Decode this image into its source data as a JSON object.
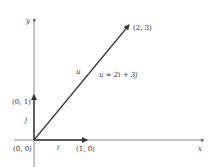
{
  "diagram": {
    "axes": {
      "x_label": "x",
      "y_label": "y",
      "origin_label": "(0, 0)"
    },
    "vectors": [
      {
        "name": "i",
        "label": "i",
        "tip_label": "(1, 0)"
      },
      {
        "name": "j",
        "label": "j",
        "tip_label": "(0, 1)"
      },
      {
        "name": "u",
        "label": "u",
        "tip_label": "(2, 3)",
        "equation": "u = 2i + 3j"
      }
    ],
    "colors": {
      "axis": "#888888",
      "vector": "#333333",
      "text": "#333333"
    }
  }
}
